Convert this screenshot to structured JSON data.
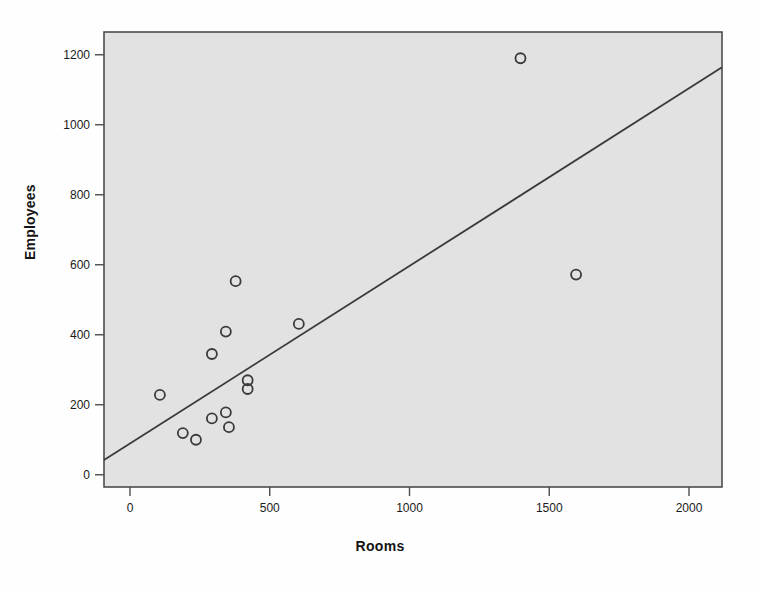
{
  "chart_data": {
    "type": "scatter",
    "title": "",
    "xlabel": "Rooms",
    "ylabel": "Employees",
    "xlim": [
      -93,
      2118
    ],
    "ylim": [
      -35,
      1265
    ],
    "xticks": [
      0,
      500,
      1000,
      1500,
      2000
    ],
    "yticks": [
      0,
      200,
      400,
      600,
      800,
      1000,
      1200
    ],
    "xtick_labels": [
      "0",
      "500",
      "1000",
      "1500",
      "2000"
    ],
    "ytick_labels": [
      "0",
      "200",
      "400",
      "600",
      "800",
      "1000",
      "1200"
    ],
    "grid": false,
    "legend": null,
    "marker": "open-circle",
    "plot_background": "#e2e2e2",
    "frame_color": "#4d4d4d",
    "marker_color": "#3a3a3a",
    "line_color": "#3a3a3a",
    "points": [
      {
        "x": 107,
        "y": 228
      },
      {
        "x": 189,
        "y": 119
      },
      {
        "x": 236,
        "y": 100
      },
      {
        "x": 293,
        "y": 345
      },
      {
        "x": 293,
        "y": 161
      },
      {
        "x": 343,
        "y": 409
      },
      {
        "x": 343,
        "y": 178
      },
      {
        "x": 354,
        "y": 136
      },
      {
        "x": 378,
        "y": 553
      },
      {
        "x": 421,
        "y": 270
      },
      {
        "x": 421,
        "y": 245
      },
      {
        "x": 604,
        "y": 431
      },
      {
        "x": 1397,
        "y": 1190
      },
      {
        "x": 1596,
        "y": 572
      }
    ],
    "fit_line": {
      "type": "linear-regression",
      "x_start": -93,
      "y_start": 42,
      "x_end": 2118,
      "y_end": 1164
    }
  }
}
